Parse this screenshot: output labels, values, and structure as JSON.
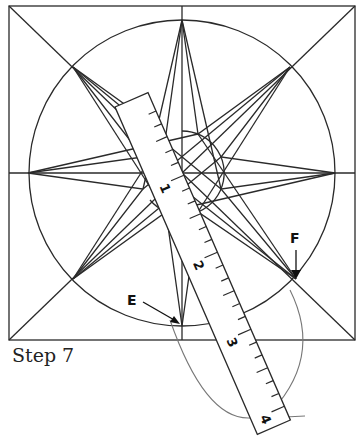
{
  "caption": "Step 7",
  "labels": {
    "E": "E",
    "F": "F"
  },
  "ruler": {
    "numbers": [
      "1",
      "2",
      "3",
      "4",
      "5",
      "6"
    ]
  },
  "colors": {
    "line": "#2a2a2a",
    "arc": "#777777"
  }
}
